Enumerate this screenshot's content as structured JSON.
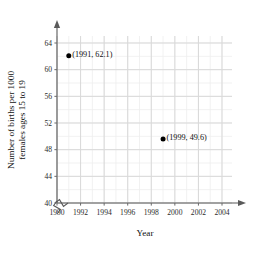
{
  "chart_data": {
    "type": "scatter",
    "title": "",
    "xlabel": "Year",
    "ylabel": "Number of births per 1000 females ages 15 to 19",
    "ylabel_line1": "Number of births per 1000",
    "ylabel_line2": "females ages 15 to 19",
    "xlim": [
      1990,
      2004
    ],
    "ylim": [
      40,
      64
    ],
    "x_ticks": [
      1990,
      1992,
      1994,
      1996,
      1998,
      2000,
      2002,
      2004
    ],
    "x_tick_labels": [
      "1990",
      "1992",
      "1994",
      "1996",
      "1998",
      "2000",
      "2002",
      "2004"
    ],
    "y_ticks": [
      40,
      44,
      48,
      52,
      56,
      60,
      64
    ],
    "y_tick_labels": [
      "40",
      "44",
      "48",
      "52",
      "56",
      "60",
      "64"
    ],
    "x_minor_step": 1,
    "y_minor_step": 2,
    "grid": true,
    "grid_minor": true,
    "legend": "none",
    "axis_break_x": true,
    "axis_break_y": true,
    "points": [
      {
        "x": 1991,
        "y": 62.1,
        "label": "(1991, 62.1)"
      },
      {
        "x": 1999,
        "y": 49.6,
        "label": "(1999, 49.6)"
      }
    ],
    "colors": {
      "point": "#000000",
      "axis": "#5a5a5a",
      "grid_minor": "#eeeeee",
      "grid_major": "#d9d9d9",
      "text": "#111111",
      "background": "#ffffff"
    }
  }
}
